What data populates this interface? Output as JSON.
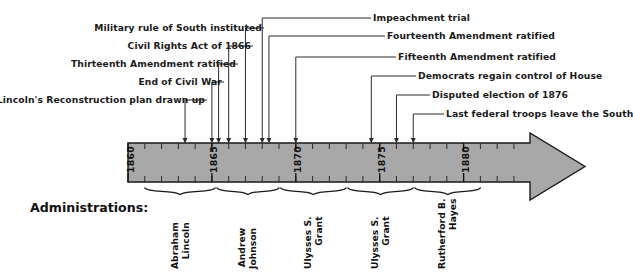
{
  "diagram": {
    "type": "timeline",
    "title_label": "Administrations:",
    "axis": {
      "start_year": 1860,
      "end_year": 1884,
      "tick_interval_years": 1,
      "labeled_years": [
        "1860",
        "1865",
        "1870",
        "1875",
        "1880"
      ],
      "bar_color": "#a8a8a8",
      "bar_border_color": "#1a1a1a",
      "direction": "right-arrow"
    },
    "events": [
      {
        "label": "Lincoln's Reconstruction plan drawn up",
        "year": 1863.4
      },
      {
        "label": "End of Civil War",
        "year": 1865.0
      },
      {
        "label": "Thirteenth Amendment ratified",
        "year": 1865.4
      },
      {
        "label": "Civil Rights Act of 1866",
        "year": 1866.0
      },
      {
        "label": "Military rule of South instituted",
        "year": 1867.0
      },
      {
        "label": "Impeachment trial",
        "year": 1868.0
      },
      {
        "label": "Fourteenth Amendment ratified",
        "year": 1868.4
      },
      {
        "label": "Fifteenth Amendment ratified",
        "year": 1870.0
      },
      {
        "label": "Democrats regain control of House",
        "year": 1874.5
      },
      {
        "label": "Disputed election of 1876",
        "year": 1876.0
      },
      {
        "label": "Last federal troops leave the South",
        "year": 1877.0
      }
    ],
    "administrations": [
      {
        "name_line1": "Abraham",
        "name_line2": "Lincoln",
        "start_year": 1861,
        "end_year": 1865.2
      },
      {
        "name_line1": "Andrew",
        "name_line2": "Johnson",
        "start_year": 1865.3,
        "end_year": 1869
      },
      {
        "name_line1": "Ulysses S.",
        "name_line2": "Grant",
        "start_year": 1869.1,
        "end_year": 1873
      },
      {
        "name_line1": "Ulysses S.",
        "name_line2": "Grant",
        "start_year": 1873.1,
        "end_year": 1877
      },
      {
        "name_line1": "Rutherford B.",
        "name_line2": "Hayes",
        "start_year": 1877.1,
        "end_year": 1881
      }
    ]
  }
}
